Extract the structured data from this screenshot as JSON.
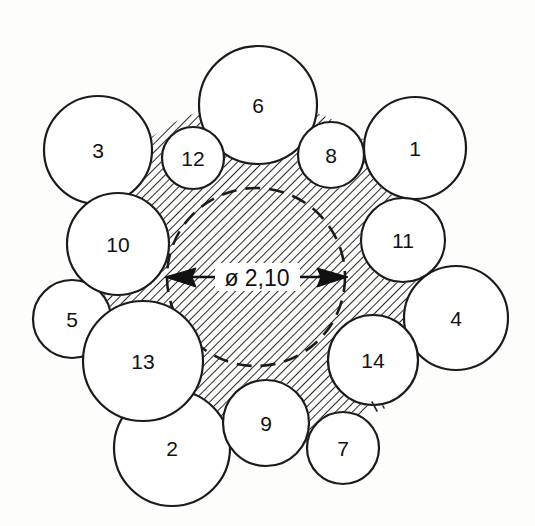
{
  "figure": {
    "type": "engineering-circle-packing-diagram",
    "background_color": "#fdfdfc",
    "line_color": "#1b1b1b",
    "hatch_color": "#2b2b2b",
    "fill_color": "#ffffff"
  },
  "dimension": {
    "label": "ø 2,10",
    "diameter_symbol": "ø",
    "value": "2,10",
    "left_arrow": "arrow-left",
    "right_arrow": "arrow-right",
    "line_y": 277,
    "line_x_start": 165,
    "line_x_end": 348
  },
  "center_circle": {
    "name": "central-bore",
    "style": "dashed",
    "cx": 256,
    "cy": 277,
    "r": 89
  },
  "hatch": {
    "pattern": "diagonal-45",
    "spacing": 6,
    "angle_deg": 45
  },
  "circles": [
    {
      "label": "1",
      "cx": 415,
      "cy": 148,
      "r": 51
    },
    {
      "label": "2",
      "cx": 172,
      "cy": 448,
      "r": 58
    },
    {
      "label": "3",
      "cx": 98,
      "cy": 150,
      "r": 54
    },
    {
      "label": "4",
      "cx": 456,
      "cy": 318,
      "r": 52
    },
    {
      "label": "5",
      "cx": 72,
      "cy": 319,
      "r": 39
    },
    {
      "label": "6",
      "cx": 258,
      "cy": 105,
      "r": 59
    },
    {
      "label": "7",
      "cx": 343,
      "cy": 448,
      "r": 36
    },
    {
      "label": "8",
      "cx": 331,
      "cy": 155,
      "r": 33
    },
    {
      "label": "9",
      "cx": 266,
      "cy": 423,
      "r": 43
    },
    {
      "label": "10",
      "cx": 118,
      "cy": 244,
      "r": 51
    },
    {
      "label": "11",
      "cx": 403,
      "cy": 240,
      "r": 42
    },
    {
      "label": "12",
      "cx": 193,
      "cy": 158,
      "r": 31
    },
    {
      "label": "13",
      "cx": 143,
      "cy": 361,
      "r": 60
    },
    {
      "label": "14",
      "cx": 373,
      "cy": 360,
      "r": 45
    }
  ]
}
